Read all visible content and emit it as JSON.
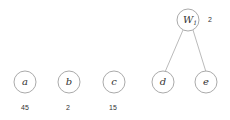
{
  "diagram": {
    "root": {
      "label": "W",
      "subscript": "1",
      "weight": "2"
    },
    "leaves": [
      {
        "label": "a",
        "weight": "45"
      },
      {
        "label": "b",
        "weight": "2"
      },
      {
        "label": "c",
        "weight": "15"
      },
      {
        "label": "d",
        "weight": ""
      },
      {
        "label": "e",
        "weight": ""
      }
    ],
    "edges": [
      [
        "W1",
        "d"
      ],
      [
        "W1",
        "e"
      ]
    ]
  }
}
